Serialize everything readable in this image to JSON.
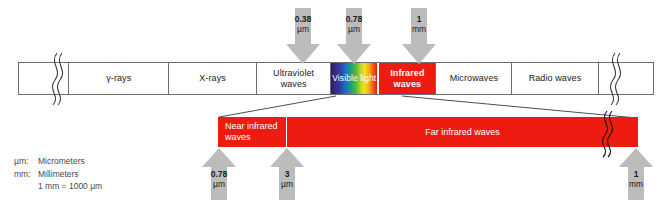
{
  "main_bar": {
    "segments": [
      {
        "name": "lead-in",
        "label": "",
        "width": 58,
        "type": "blank"
      },
      {
        "name": "gamma-rays",
        "label": "γ-rays",
        "width": 116,
        "type": "plain"
      },
      {
        "name": "x-rays",
        "label": "X-rays",
        "width": 102,
        "type": "plain"
      },
      {
        "name": "ultraviolet",
        "label": "Ultraviolet\nwaves",
        "width": 86,
        "type": "plain"
      },
      {
        "name": "visible-light",
        "label": "Visible light",
        "width": 54,
        "type": "rainbow"
      },
      {
        "name": "infrared",
        "label": "Infrared\nwaves",
        "width": 66,
        "type": "red"
      },
      {
        "name": "microwaves",
        "label": "Microwaves",
        "width": 88,
        "type": "plain"
      },
      {
        "name": "radio-waves",
        "label": "Radio waves",
        "width": 100,
        "type": "plain"
      },
      {
        "name": "lead-out",
        "label": "",
        "width": 64,
        "type": "blank"
      }
    ]
  },
  "top_arrows": [
    {
      "name": "arrow-0-38-um",
      "value": "0.38",
      "unit": "µm",
      "x": 286
    },
    {
      "name": "arrow-0-78-um",
      "value": "0.78",
      "unit": "µm",
      "x": 337
    },
    {
      "name": "arrow-1-mm",
      "value": "1",
      "unit": "mm",
      "x": 402
    }
  ],
  "ir_bar": {
    "segments": [
      {
        "name": "near-infrared-waves",
        "label": "Near infrared\nwaves"
      },
      {
        "name": "far-infrared-waves",
        "label": "Far infrared waves"
      }
    ]
  },
  "bottom_arrows": [
    {
      "name": "arrow-0-78-um-lower",
      "value": "0.78",
      "unit": "µm",
      "x": 202
    },
    {
      "name": "arrow-3-um",
      "value": "3",
      "unit": "µm",
      "x": 270
    },
    {
      "name": "arrow-1-mm-lower",
      "value": "1",
      "unit": "mm",
      "x": 619
    }
  ],
  "legend": {
    "rows": [
      {
        "key": "µm:",
        "text": "Micrometers"
      },
      {
        "key": "mm:",
        "text": "Millimeters"
      },
      {
        "key": "",
        "text": "1 mm = 1000 µm"
      }
    ]
  },
  "colors": {
    "infrared_red": "#ee1b11",
    "arrow_gray": "#bcbcbc",
    "bar_outline": "#6e6e6e",
    "text": "#1a1a1a"
  }
}
